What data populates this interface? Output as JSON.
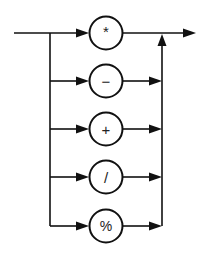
{
  "diagram": {
    "type": "syntax-diagram",
    "colors": {
      "stroke": "#111111",
      "background": "#ffffff"
    },
    "operators": [
      {
        "symbol": "*",
        "name": "multiply"
      },
      {
        "symbol": "−",
        "name": "subtract"
      },
      {
        "symbol": "+",
        "name": "add"
      },
      {
        "symbol": "/",
        "name": "divide"
      },
      {
        "symbol": "%",
        "name": "modulo"
      }
    ]
  }
}
